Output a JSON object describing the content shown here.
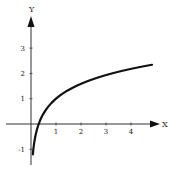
{
  "chart_data": {
    "type": "line",
    "title": "",
    "xlabel": "X",
    "ylabel": "Y",
    "x_ticks": [
      "1",
      "2",
      "3",
      "4"
    ],
    "y_ticks": [
      "-1",
      "1",
      "2",
      "3"
    ],
    "xlim": [
      -1.0,
      5.2
    ],
    "ylim": [
      -1.6,
      4.4
    ],
    "grid": false,
    "legend": null,
    "series": [
      {
        "name": "curve",
        "description": "logarithmic curve, approx y = 1 + 0.85 ln(x)",
        "x": [
          0.08,
          0.15,
          0.25,
          0.31,
          0.5,
          0.75,
          1.0,
          1.5,
          2.0,
          2.5,
          3.0,
          3.5,
          4.0,
          4.5,
          4.84
        ],
        "y": [
          -1.15,
          -0.61,
          -0.18,
          0.0,
          0.41,
          0.76,
          1.0,
          1.34,
          1.59,
          1.78,
          1.93,
          2.06,
          2.18,
          2.28,
          2.34
        ]
      }
    ],
    "colors": {
      "curve": "#111111",
      "axes": "#333333"
    }
  }
}
